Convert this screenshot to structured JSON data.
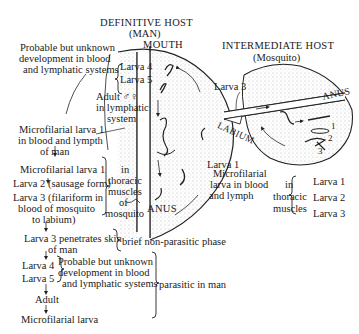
{
  "definitive_host": {
    "title": "DEFINITIVE HOST",
    "subtitle": "(MAN)",
    "mouth_label": "MOUTH",
    "anus_label": "ANUS",
    "larva_4": "Larva 4",
    "larva_5": "Larva 5",
    "adult_line1": "Adult ♂♀",
    "adult_line2": "in lymphatic",
    "adult_line3": "system",
    "larva_3": "Larva 3",
    "larva_1": "Larva 1"
  },
  "intermediate_host": {
    "title": "INTERMEDIATE HOST",
    "subtitle": "(Mosquito)",
    "anus_label": "ANUS",
    "labium_label": "LABIUM",
    "stage_numbers": [
      "1",
      "2",
      "3"
    ]
  },
  "annotations": {
    "probable_top_1": "Probable but unknown",
    "probable_top_2": "development in blood",
    "probable_top_3": "and lymphatic systems",
    "microfilarial_man_1": "Microfilarial larva 1",
    "microfilarial_man_2": "in blood and lympth",
    "microfilarial_man_3": "of man",
    "microfilarial_lymph_1": "Microfilarial",
    "microfilarial_lymph_2": "larva in blood",
    "microfilarial_lymph_3": "and lymph",
    "thoracic_right_1": "in",
    "thoracic_right_2": "thoracic",
    "thoracic_right_3": "muscles",
    "thoracic_right_larvae": [
      "Larva 1",
      "Larva 2",
      "Larva 3"
    ]
  },
  "life_cycle": {
    "mosquito_stages": {
      "s1": "Microfilarial larva 1",
      "s2": "Larva 2 (sausage form)",
      "s3_1": "Larva 3 (filariform in",
      "s3_2": "blood of mosquito",
      "s3_3": "to labium)",
      "bracket_1": "in",
      "bracket_2": "thoracic",
      "bracket_3": "muscles",
      "bracket_4": "of",
      "bracket_5": "mosquito"
    },
    "penetration_1": "Larva 3 penetrates skin",
    "penetration_2": "of man",
    "brief_phase": "brief non-parasitic phase",
    "larva_4": "Larva 4",
    "larva_5": "Larva 5",
    "probable_1": "Probable but unknown",
    "probable_2": "development in blood",
    "probable_3": "and lymphatic systems",
    "parasitic": "parasitic in man",
    "adult": "Adult",
    "final": "Microfilarial larva"
  }
}
